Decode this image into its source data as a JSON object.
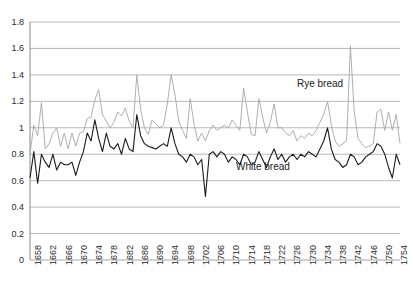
{
  "chart_data": {
    "type": "line",
    "title": "",
    "xlabel": "",
    "ylabel": "",
    "ylim": [
      0,
      1.8
    ],
    "ytick_step": 0.2,
    "yticks": [
      "0",
      "0.2",
      "0.4",
      "0.6",
      "0.8",
      "1",
      "1.2",
      "1.4",
      "1.6",
      "1.8"
    ],
    "grid": true,
    "legend_position": "inline-annotations",
    "x_start": 1658,
    "x_end": 1755,
    "xticks": [
      "1658",
      "1662",
      "1666",
      "1670",
      "1674",
      "1678",
      "1682",
      "1686",
      "1690",
      "1694",
      "1698",
      "1702",
      "1706",
      "1710",
      "1714",
      "1718",
      "1722",
      "1726",
      "1730",
      "1734",
      "1738",
      "1742",
      "1746",
      "1750",
      "1754"
    ],
    "annotations": [
      {
        "text": "Rye bread",
        "x": 1728,
        "y": 1.33
      },
      {
        "text": "White bread",
        "x": 1712,
        "y": 0.7
      }
    ],
    "series": [
      {
        "name": "Rye bread",
        "color": "#a6a6a6",
        "values": [
          0.8,
          1.02,
          0.94,
          1.19,
          0.84,
          0.88,
          0.96,
          1.0,
          0.86,
          0.96,
          0.84,
          0.96,
          0.86,
          0.96,
          0.97,
          1.07,
          1.08,
          1.21,
          1.29,
          1.1,
          1.05,
          1.0,
          1.04,
          1.12,
          1.09,
          1.15,
          1.05,
          1.0,
          1.4,
          1.14,
          1.0,
          0.95,
          1.06,
          1.03,
          1.0,
          1.02,
          1.18,
          1.4,
          1.25,
          1.05,
          0.98,
          0.92,
          1.22,
          1.03,
          0.9,
          0.96,
          0.9,
          0.98,
          1.02,
          0.98,
          1.0,
          1.02,
          1.0,
          1.06,
          1.02,
          0.98,
          1.3,
          1.12,
          0.95,
          0.94,
          1.22,
          1.08,
          0.96,
          1.04,
          1.18,
          1.0,
          1.0,
          0.96,
          0.94,
          0.98,
          0.9,
          0.94,
          0.92,
          0.96,
          0.94,
          0.98,
          1.04,
          1.1,
          1.2,
          1.02,
          0.9,
          0.86,
          0.88,
          0.9,
          1.62,
          1.12,
          0.92,
          0.88,
          0.85,
          0.86,
          0.88,
          1.12,
          1.14,
          0.98,
          1.12,
          0.98,
          1.1,
          0.88
        ]
      },
      {
        "name": "White bread",
        "color": "#1a1a1a",
        "values": [
          0.62,
          0.82,
          0.58,
          0.8,
          0.74,
          0.7,
          0.8,
          0.68,
          0.74,
          0.72,
          0.72,
          0.74,
          0.64,
          0.74,
          0.82,
          0.96,
          0.9,
          1.06,
          0.92,
          0.82,
          0.96,
          0.86,
          0.84,
          0.88,
          0.8,
          0.92,
          0.84,
          0.82,
          1.1,
          0.94,
          0.88,
          0.86,
          0.85,
          0.84,
          0.86,
          0.88,
          0.86,
          1.0,
          0.88,
          0.8,
          0.78,
          0.74,
          0.8,
          0.78,
          0.72,
          0.76,
          0.48,
          0.8,
          0.82,
          0.78,
          0.82,
          0.8,
          0.74,
          0.78,
          0.76,
          0.72,
          0.8,
          0.78,
          0.72,
          0.74,
          0.82,
          0.76,
          0.7,
          0.78,
          0.84,
          0.76,
          0.8,
          0.74,
          0.78,
          0.8,
          0.76,
          0.8,
          0.78,
          0.82,
          0.8,
          0.78,
          0.84,
          0.9,
          1.0,
          0.84,
          0.76,
          0.74,
          0.7,
          0.72,
          0.8,
          0.78,
          0.72,
          0.74,
          0.78,
          0.8,
          0.82,
          0.88,
          0.86,
          0.8,
          0.7,
          0.62,
          0.8,
          0.72
        ]
      }
    ]
  },
  "axis": {
    "plot_left": 30,
    "plot_right": 400,
    "plot_top": 22,
    "plot_bottom": 260
  }
}
